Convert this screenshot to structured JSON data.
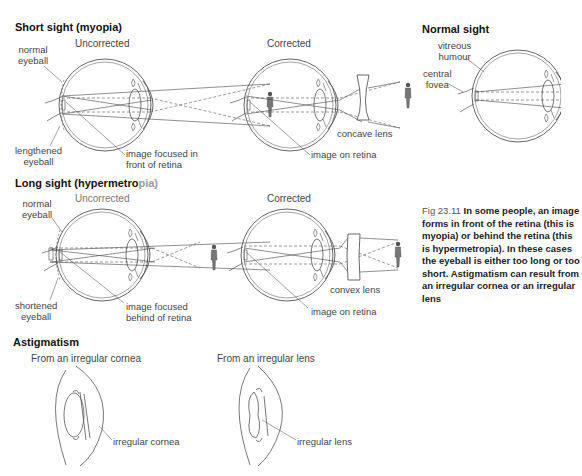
{
  "sections": {
    "myopia": {
      "heading": "Short sight (myopia)",
      "uncorrected": "Uncorrected",
      "corrected": "Corrected",
      "labels": {
        "normal_eyeball_1": "normal",
        "normal_eyeball_2": "eyeball",
        "lengthened_1": "lengthened",
        "lengthened_2": "eyeball",
        "image_front_1": "image focused in",
        "image_front_2": "front of retina",
        "concave_lens": "concave lens",
        "image_on_retina": "image on retina"
      }
    },
    "normal": {
      "heading": "Normal sight",
      "labels": {
        "vitreous_1": "vitreous",
        "vitreous_2": "humour",
        "fovea_1": "central",
        "fovea_2": "fovea"
      }
    },
    "hypermetropia": {
      "heading_a": "Long sight (",
      "heading_b": "hypermetro",
      "heading_c": "pia)",
      "uncorrected": "Uncorrected",
      "corrected": "Corrected",
      "labels": {
        "normal_eyeball_1": "normal",
        "normal_eyeball_2": "eyeball",
        "shortened_1": "shortened",
        "shortened_2": "eyeball",
        "image_behind_1": "image focused",
        "image_behind_2": "behind of retina",
        "convex_lens": "convex lens",
        "image_on_retina": "image on retina"
      }
    },
    "astigmatism": {
      "heading": "Astigmatism",
      "cornea_title": "From an irregular cornea",
      "cornea_label": "irregular cornea",
      "lens_title": "From an irregular lens",
      "lens_label": "irregular lens"
    }
  },
  "caption": {
    "fig": "Fig 23.11",
    "text": "In some people, an image forms in front of the retina (this is myopia) or behind the retina (this is hypermetropia). In these cases the eyeball is either too long or too short. Astigmatism can result from an irregular cornea or an irregular lens"
  }
}
